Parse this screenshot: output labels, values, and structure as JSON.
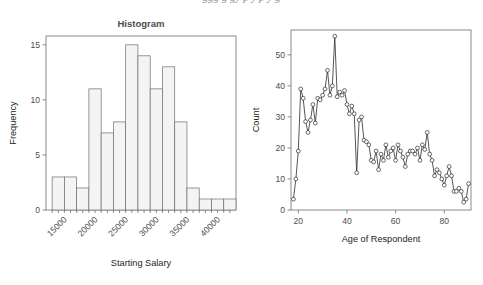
{
  "page": {
    "cut_off_caption": "ggg g gy p y p y g"
  },
  "chart_data": [
    {
      "id": "histogram",
      "type": "bar",
      "title": "Histogram",
      "xlabel": "Starting Salary",
      "ylabel": "Frequency",
      "xlim": [
        12000,
        43000
      ],
      "ylim": [
        0,
        15.8
      ],
      "yticks": [
        0,
        5,
        10,
        15
      ],
      "ytick_labels": [
        "0",
        "5",
        "10",
        "15"
      ],
      "xticks": [
        15000,
        20000,
        25000,
        30000,
        35000,
        40000
      ],
      "xtick_labels": [
        "15000",
        "20000",
        "25000",
        "30000",
        "35000",
        "40000"
      ],
      "xtick_rotation_deg": 45,
      "minor_xticks": [
        13000,
        14000,
        15000,
        16000,
        17000,
        18000,
        19000,
        20000,
        21000,
        22000,
        23000,
        24000,
        25000,
        26000,
        27000,
        28000,
        29000,
        30000,
        31000,
        32000,
        33000,
        34000,
        35000,
        36000,
        37000,
        38000,
        39000,
        40000,
        41000,
        42000
      ],
      "bin_width": 2000,
      "bin_starts": [
        13000,
        15000,
        17000,
        19000,
        21000,
        23000,
        25000,
        27000,
        29000,
        31000,
        33000,
        35000,
        37000,
        39000,
        41000
      ],
      "values": [
        3,
        3,
        2,
        11,
        7,
        8,
        15,
        14,
        11,
        13,
        8,
        2,
        1,
        1,
        1
      ],
      "grid": false,
      "legend": "none",
      "bar_fill": "#f4f4f4",
      "bar_stroke": "#6d6e71"
    },
    {
      "id": "age-count-line",
      "type": "line",
      "title": "",
      "xlabel": "Age of Respondent",
      "ylabel": "Count",
      "xlim": [
        17,
        91
      ],
      "ylim": [
        0,
        58
      ],
      "yticks": [
        0,
        10,
        20,
        30,
        40,
        50
      ],
      "ytick_labels": [
        "0",
        "10",
        "20",
        "30",
        "40",
        "50"
      ],
      "xticks": [
        20,
        40,
        60,
        80
      ],
      "xtick_labels": [
        "20",
        "40",
        "60",
        "80"
      ],
      "grid": false,
      "legend": "none",
      "markers": "open-circle",
      "line_color": "#2b2b2b",
      "marker_fill": "#ffffff",
      "x": [
        18,
        19,
        20,
        21,
        22,
        23,
        24,
        25,
        26,
        27,
        28,
        29,
        30,
        31,
        32,
        33,
        34,
        35,
        36,
        37,
        38,
        39,
        40,
        41,
        42,
        43,
        44,
        45,
        46,
        47,
        48,
        49,
        50,
        51,
        52,
        53,
        54,
        55,
        56,
        57,
        58,
        59,
        60,
        61,
        62,
        63,
        64,
        65,
        66,
        67,
        68,
        69,
        70,
        71,
        72,
        73,
        74,
        75,
        76,
        77,
        78,
        79,
        80,
        81,
        82,
        83,
        84,
        85,
        86,
        87,
        88,
        89,
        90
      ],
      "y": [
        3.5,
        10,
        19,
        39,
        36,
        28.5,
        25,
        29,
        34,
        28,
        36,
        35.5,
        37,
        39,
        45,
        37,
        40,
        56,
        36.5,
        38,
        37,
        38.5,
        34,
        31,
        33.5,
        31,
        12,
        29,
        30,
        22.5,
        22,
        21,
        16,
        15.5,
        19,
        13,
        18,
        16,
        21,
        17,
        19,
        20,
        16,
        21,
        19,
        17,
        14,
        18,
        19,
        19,
        18,
        20,
        16,
        21,
        19.5,
        25,
        18,
        16,
        11,
        13,
        12,
        10,
        8,
        11,
        14,
        11,
        6,
        6,
        7,
        6,
        2.5,
        3.5,
        8.5
      ]
    }
  ]
}
